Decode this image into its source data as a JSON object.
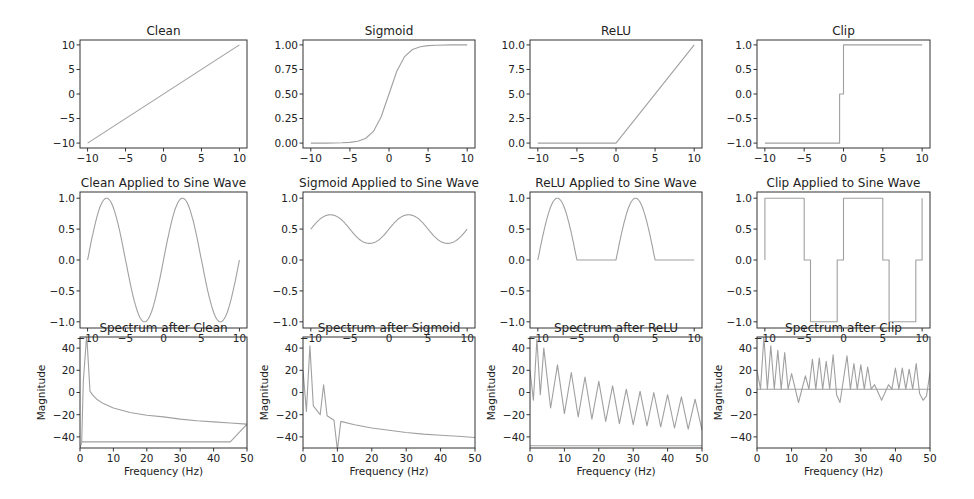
{
  "figure": {
    "layout": "3x4 grid of subplots",
    "line_color": "#a0a0a0",
    "axes_color": "#333333"
  },
  "chart_data": [
    {
      "id": "clean",
      "row": 0,
      "col": 0,
      "type": "line",
      "title": "Clean",
      "xlabel": "",
      "ylabel": "",
      "xlim": [
        -11,
        11
      ],
      "ylim": [
        -11,
        11
      ],
      "xticks": [
        -10,
        -5,
        0,
        5,
        10
      ],
      "xtick_labels": [
        "−10",
        "−5",
        "0",
        "5",
        "10"
      ],
      "yticks": [
        -10,
        -5,
        0,
        5,
        10
      ],
      "ytick_labels": [
        "−10",
        "−5",
        "0",
        "5",
        "10"
      ],
      "series": [
        {
          "name": "f(x)=x",
          "x": [
            -10,
            10
          ],
          "y": [
            -10,
            10
          ]
        }
      ]
    },
    {
      "id": "sigmoid",
      "row": 0,
      "col": 1,
      "type": "line",
      "title": "Sigmoid",
      "xlabel": "",
      "ylabel": "",
      "xlim": [
        -11,
        11
      ],
      "ylim": [
        -0.05,
        1.05
      ],
      "xticks": [
        -10,
        -5,
        0,
        5,
        10
      ],
      "xtick_labels": [
        "−10",
        "−5",
        "0",
        "5",
        "10"
      ],
      "yticks": [
        0,
        0.25,
        0.5,
        0.75,
        1.0
      ],
      "ytick_labels": [
        "0.00",
        "0.25",
        "0.50",
        "0.75",
        "1.00"
      ],
      "series": [
        {
          "name": "sigmoid(x)",
          "x": [
            -10,
            -8,
            -6,
            -5,
            -4,
            -3,
            -2,
            -1,
            0,
            1,
            2,
            3,
            4,
            5,
            6,
            8,
            10
          ],
          "y": [
            0.0,
            0.0003,
            0.0025,
            0.0067,
            0.018,
            0.047,
            0.119,
            0.269,
            0.5,
            0.731,
            0.881,
            0.953,
            0.982,
            0.993,
            0.9975,
            0.9997,
            1.0
          ]
        }
      ]
    },
    {
      "id": "relu",
      "row": 0,
      "col": 2,
      "type": "line",
      "title": "ReLU",
      "xlabel": "",
      "ylabel": "",
      "xlim": [
        -11,
        11
      ],
      "ylim": [
        -0.5,
        10.5
      ],
      "xticks": [
        -10,
        -5,
        0,
        5,
        10
      ],
      "xtick_labels": [
        "−10",
        "−5",
        "0",
        "5",
        "10"
      ],
      "yticks": [
        0,
        2.5,
        5,
        7.5,
        10
      ],
      "ytick_labels": [
        "0.0",
        "2.5",
        "5.0",
        "7.5",
        "10.0"
      ],
      "series": [
        {
          "name": "relu(x)",
          "x": [
            -10,
            0,
            10
          ],
          "y": [
            0,
            0,
            10
          ]
        }
      ]
    },
    {
      "id": "clip",
      "row": 0,
      "col": 3,
      "type": "line",
      "title": "Clip",
      "xlabel": "",
      "ylabel": "",
      "xlim": [
        -11,
        11
      ],
      "ylim": [
        -1.1,
        1.1
      ],
      "xticks": [
        -10,
        -5,
        0,
        5,
        10
      ],
      "xtick_labels": [
        "−10",
        "−5",
        "0",
        "5",
        "10"
      ],
      "yticks": [
        -1,
        -0.5,
        0,
        0.5,
        1
      ],
      "ytick_labels": [
        "−1.0",
        "−0.5",
        "0.0",
        "0.5",
        "1.0"
      ],
      "series": [
        {
          "name": "clip(x)",
          "x": [
            -10,
            -0.5,
            -0.5,
            0,
            0,
            10
          ],
          "y": [
            -1,
            -1,
            0,
            0,
            1,
            1
          ]
        }
      ]
    },
    {
      "id": "clean_sine",
      "row": 1,
      "col": 0,
      "type": "line",
      "title": "Clean Applied to Sine Wave",
      "xlabel": "",
      "ylabel": "",
      "xlim": [
        -11,
        11
      ],
      "ylim": [
        -1.1,
        1.1
      ],
      "xticks": [
        -10,
        -5,
        0,
        5,
        10
      ],
      "xtick_labels": [
        "−10",
        "−5",
        "0",
        "5",
        "10"
      ],
      "yticks": [
        -1,
        -0.5,
        0,
        0.5,
        1
      ],
      "ytick_labels": [
        "−1.0",
        "−0.5",
        "0.0",
        "0.5",
        "1.0"
      ],
      "series": [
        {
          "name": "sin",
          "function": "sin(2*pi*0.1*x)",
          "x_range": [
            -10,
            10
          ]
        }
      ]
    },
    {
      "id": "sigmoid_sine",
      "row": 1,
      "col": 1,
      "type": "line",
      "title": "Sigmoid Applied to Sine Wave",
      "xlabel": "",
      "ylabel": "",
      "xlim": [
        -11,
        11
      ],
      "ylim": [
        -1.1,
        1.1
      ],
      "xticks": [
        -10,
        -5,
        0,
        5,
        10
      ],
      "xtick_labels": [
        "−10",
        "−5",
        "0",
        "5",
        "10"
      ],
      "yticks": [
        -1,
        -0.5,
        0,
        0.5,
        1
      ],
      "ytick_labels": [
        "−1.0",
        "−0.5",
        "0.0",
        "0.5",
        "1.0"
      ],
      "series": [
        {
          "name": "sigmoid(sin)",
          "function": "1/(1+exp(-sin(2*pi*0.1*x)))",
          "x_range": [
            -10,
            10
          ],
          "y_min": 0.27,
          "y_max": 0.73
        }
      ]
    },
    {
      "id": "relu_sine",
      "row": 1,
      "col": 2,
      "type": "line",
      "title": "ReLU Applied to Sine Wave",
      "xlabel": "",
      "ylabel": "",
      "xlim": [
        -11,
        11
      ],
      "ylim": [
        -1.1,
        1.1
      ],
      "xticks": [
        -10,
        -5,
        0,
        5,
        10
      ],
      "xtick_labels": [
        "−10",
        "−5",
        "0",
        "5",
        "10"
      ],
      "yticks": [
        -1,
        -0.5,
        0,
        0.5,
        1
      ],
      "ytick_labels": [
        "−1.0",
        "−0.5",
        "0.0",
        "0.5",
        "1.0"
      ],
      "series": [
        {
          "name": "relu(sin)",
          "function": "max(0, sin(2*pi*0.1*x))",
          "x_range": [
            -10,
            10
          ]
        }
      ]
    },
    {
      "id": "clip_sine",
      "row": 1,
      "col": 3,
      "type": "line",
      "title": "Clip Applied to Sine Wave",
      "xlabel": "",
      "ylabel": "",
      "xlim": [
        -11,
        11
      ],
      "ylim": [
        -1.1,
        1.1
      ],
      "xticks": [
        -10,
        -5,
        0,
        5,
        10
      ],
      "xtick_labels": [
        "−10",
        "−5",
        "0",
        "5",
        "10"
      ],
      "yticks": [
        -1,
        -0.5,
        0,
        0.5,
        1
      ],
      "ytick_labels": [
        "−1.0",
        "−0.5",
        "0.0",
        "0.5",
        "1.0"
      ],
      "series": [
        {
          "name": "clip(sin)",
          "x": [
            -10,
            -10,
            -5,
            -5,
            -4.2,
            -4.2,
            -0.8,
            -0.8,
            0,
            0,
            5,
            5,
            5.8,
            5.8,
            9.2,
            9.2,
            10,
            10
          ],
          "y": [
            0,
            1,
            1,
            0,
            0,
            -1,
            -1,
            0,
            0,
            1,
            1,
            0,
            0,
            -1,
            -1,
            0,
            0,
            1
          ]
        }
      ]
    },
    {
      "id": "spectrum_clean",
      "row": 2,
      "col": 0,
      "type": "line",
      "title": "Spectrum after Clean",
      "xlabel": "Frequency (Hz)",
      "ylabel": "Magnitude",
      "xlim": [
        0,
        50
      ],
      "ylim": [
        -50,
        50
      ],
      "xticks": [
        0,
        10,
        20,
        30,
        40,
        50
      ],
      "xtick_labels": [
        "0",
        "10",
        "20",
        "30",
        "40",
        "50"
      ],
      "yticks": [
        -40,
        -20,
        0,
        20,
        40
      ],
      "ytick_labels": [
        "−40",
        "−20",
        "0",
        "20",
        "40"
      ],
      "series": [
        {
          "name": "magnitude",
          "x": [
            0,
            0.5,
            1,
            2,
            3,
            4,
            5,
            7,
            10,
            15,
            20,
            25,
            30,
            35,
            40,
            45,
            50,
            45,
            30,
            10,
            0.5
          ],
          "y": [
            -50,
            -45,
            10,
            52,
            1,
            -3,
            -6,
            -10,
            -14,
            -18,
            -20.5,
            -22,
            -24,
            -25.5,
            -26.5,
            -27.5,
            -28.5,
            -44.5,
            -44.5,
            -44.5,
            -44.5
          ]
        }
      ]
    },
    {
      "id": "spectrum_sigmoid",
      "row": 2,
      "col": 1,
      "type": "line",
      "title": "Spectrum after Sigmoid",
      "xlabel": "Frequency (Hz)",
      "ylabel": "Magnitude",
      "xlim": [
        0,
        50
      ],
      "ylim": [
        -50,
        50
      ],
      "xticks": [
        0,
        10,
        20,
        30,
        40,
        50
      ],
      "xtick_labels": [
        "0",
        "10",
        "20",
        "30",
        "40",
        "50"
      ],
      "yticks": [
        -40,
        -20,
        0,
        20,
        40
      ],
      "ytick_labels": [
        "−40",
        "−20",
        "0",
        "20",
        "40"
      ],
      "series": [
        {
          "name": "magnitude",
          "x": [
            0,
            1,
            2,
            3,
            5,
            6,
            7,
            9,
            10,
            11,
            15,
            20,
            25,
            30,
            35,
            40,
            45,
            50
          ],
          "y": [
            20,
            -17,
            42,
            -12,
            -20,
            7,
            -21,
            -25,
            -52,
            -26,
            -29,
            -32,
            -34,
            -36,
            -37.5,
            -38.5,
            -39.5,
            -40.5
          ]
        }
      ]
    },
    {
      "id": "spectrum_relu",
      "row": 2,
      "col": 2,
      "type": "line",
      "title": "Spectrum after ReLU",
      "xlabel": "Frequency (Hz)",
      "ylabel": "Magnitude",
      "xlim": [
        0,
        50
      ],
      "ylim": [
        -50,
        50
      ],
      "xticks": [
        0,
        10,
        20,
        30,
        40,
        50
      ],
      "xtick_labels": [
        "0",
        "10",
        "20",
        "30",
        "40",
        "50"
      ],
      "yticks": [
        -40,
        -20,
        0,
        20,
        40
      ],
      "ytick_labels": [
        "−40",
        "−20",
        "0",
        "20",
        "40"
      ],
      "peaks": {
        "x": [
          0,
          2,
          4,
          8,
          12,
          16,
          20,
          24,
          28,
          32,
          36,
          40,
          44,
          48
        ],
        "y": [
          20,
          48,
          40,
          25,
          18,
          14,
          10,
          6,
          3,
          1,
          0,
          -2,
          -4,
          -6
        ]
      },
      "troughs": {
        "x": [
          1,
          3,
          6,
          10,
          14,
          18,
          22,
          26,
          30,
          34,
          38,
          42,
          46,
          50
        ],
        "y": [
          -7,
          -2,
          -14,
          -19,
          -22,
          -24,
          -26,
          -28,
          -29,
          -30,
          -31,
          -32,
          -33,
          -34
        ]
      },
      "baseline": -48
    },
    {
      "id": "spectrum_clip",
      "row": 2,
      "col": 3,
      "type": "line",
      "title": "Spectrum after Clip",
      "xlabel": "Frequency (Hz)",
      "ylabel": "Magnitude",
      "xlim": [
        0,
        50
      ],
      "ylim": [
        -50,
        50
      ],
      "xticks": [
        0,
        10,
        20,
        30,
        40,
        50
      ],
      "xtick_labels": [
        "0",
        "10",
        "20",
        "30",
        "40",
        "50"
      ],
      "yticks": [
        -40,
        -20,
        0,
        20,
        40
      ],
      "ytick_labels": [
        "−40",
        "−20",
        "0",
        "20",
        "40"
      ],
      "series": [
        {
          "name": "magnitude",
          "x": [
            0,
            1,
            2,
            3,
            4,
            5,
            6,
            7,
            8,
            9,
            10,
            12,
            14,
            15,
            16,
            17,
            18,
            19,
            20,
            21,
            22,
            23,
            24,
            26,
            27,
            28,
            29,
            30,
            31,
            32,
            33,
            34,
            36,
            38,
            39,
            40,
            41,
            42,
            43,
            44,
            45,
            46,
            47,
            48,
            49,
            50
          ],
          "y": [
            20,
            3,
            50,
            3,
            42,
            3,
            38,
            3,
            36,
            3,
            17,
            -9,
            15,
            3,
            30,
            3,
            31,
            3,
            28,
            3,
            34,
            -2,
            -9,
            33,
            3,
            26,
            3,
            25,
            3,
            23,
            3,
            7,
            -7,
            7,
            3,
            22,
            3,
            22,
            3,
            21,
            3,
            26,
            -1,
            -7,
            -3,
            18
          ]
        }
      ],
      "baseline": 3
    }
  ]
}
